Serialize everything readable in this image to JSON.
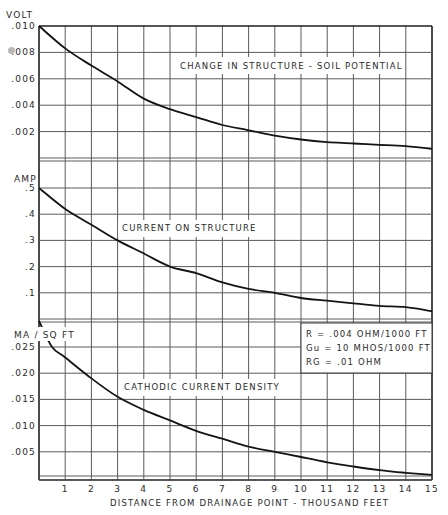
{
  "chart_data": [
    {
      "type": "line",
      "panel": "top",
      "ylabel": "VOLT",
      "annotation": "CHANGE IN STRUCTURE - SOIL POTENTIAL",
      "yticks": [
        ".010",
        ".008",
        ".006",
        ".004",
        ".002"
      ],
      "ylim": [
        0,
        0.01
      ],
      "x": [
        0,
        1,
        2,
        3,
        4,
        5,
        6,
        7,
        8,
        9,
        10,
        11,
        12,
        13,
        14,
        15
      ],
      "values": [
        0.01,
        0.0083,
        0.007,
        0.0058,
        0.0045,
        0.0037,
        0.0031,
        0.0025,
        0.0021,
        0.0017,
        0.0014,
        0.0012,
        0.0011,
        0.001,
        0.0009,
        0.0007
      ]
    },
    {
      "type": "line",
      "panel": "middle",
      "ylabel": "AMP",
      "annotation": "CURRENT ON STRUCTURE",
      "yticks": [
        ".5",
        ".4",
        ".3",
        ".2",
        ".1"
      ],
      "ylim": [
        0,
        0.5
      ],
      "x": [
        0,
        1,
        2,
        3,
        4,
        5,
        6,
        7,
        8,
        9,
        10,
        11,
        12,
        13,
        14,
        15
      ],
      "values": [
        0.5,
        0.42,
        0.36,
        0.3,
        0.25,
        0.2,
        0.175,
        0.14,
        0.115,
        0.1,
        0.08,
        0.07,
        0.06,
        0.05,
        0.045,
        0.03
      ]
    },
    {
      "type": "line",
      "panel": "bottom",
      "ylabel": "MA / SQ FT",
      "annotation": "CATHODIC CURRENT DENSITY",
      "yticks": [
        ".025",
        ".020",
        ".015",
        ".010",
        ".005"
      ],
      "ylim": [
        0,
        0.025
      ],
      "x": [
        0,
        0.5,
        1,
        2,
        3,
        4,
        5,
        6,
        7,
        8,
        9,
        10,
        11,
        12,
        13,
        14,
        15
      ],
      "values": [
        0.03,
        0.025,
        0.023,
        0.019,
        0.0155,
        0.013,
        0.011,
        0.009,
        0.0075,
        0.006,
        0.005,
        0.004,
        0.003,
        0.0022,
        0.0015,
        0.001,
        0.0006
      ]
    }
  ],
  "xaxis": {
    "label": "DISTANCE FROM DRAINAGE POINT - THOUSAND FEET",
    "ticks": [
      "1",
      "2",
      "3",
      "4",
      "5",
      "6",
      "7",
      "8",
      "9",
      "10",
      "11",
      "12",
      "13",
      "14",
      "15"
    ],
    "xlim": [
      0,
      15
    ]
  },
  "parameters": {
    "line1": "R = .004 OHM/1000 FT",
    "line2": "Gu = 10 MHOS/1000 FT",
    "line3": "RG = .01 OHM"
  }
}
